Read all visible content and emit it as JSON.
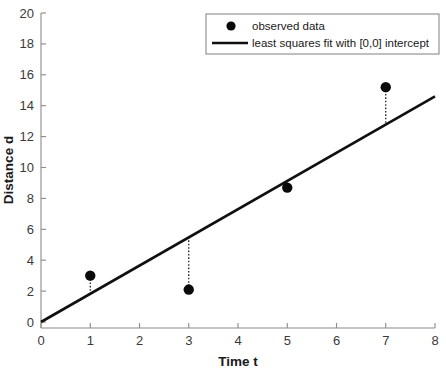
{
  "chart_data": {
    "type": "scatter",
    "title": "",
    "xlabel": "Time t",
    "ylabel": "Distance d",
    "xlim": [
      0,
      8
    ],
    "ylim": [
      0,
      20
    ],
    "xticks": [
      0,
      1,
      2,
      3,
      4,
      5,
      6,
      7,
      8
    ],
    "xtick_labels": [
      "0",
      "1",
      "2",
      "3",
      "4",
      "5",
      "6",
      "7",
      "8"
    ],
    "yticks": [
      0,
      2,
      4,
      6,
      8,
      10,
      12,
      14,
      16,
      18,
      20
    ],
    "ytick_labels": [
      "0",
      "2",
      "4",
      "6",
      "8",
      "10",
      "12",
      "14",
      "16",
      "18",
      "20"
    ],
    "grid": false,
    "legend_position": "top-right",
    "series": [
      {
        "name": "observed data",
        "type": "scatter",
        "marker": "circle",
        "color": "#0a0a0a",
        "x": [
          1,
          3,
          5,
          7
        ],
        "values": [
          3.0,
          2.1,
          8.7,
          15.2
        ]
      },
      {
        "name": "least squares fit with [0,0] intercept",
        "type": "line",
        "color": "#101010",
        "slope": 1.83,
        "intercept": 0,
        "x": [
          0,
          8
        ],
        "values": [
          0,
          14.6
        ]
      }
    ],
    "residual_stems": [
      {
        "x": 1,
        "y_data": 3.0,
        "y_fit": 1.83
      },
      {
        "x": 3,
        "y_data": 2.1,
        "y_fit": 5.49
      },
      {
        "x": 5,
        "y_data": 8.7,
        "y_fit": 9.15
      },
      {
        "x": 7,
        "y_data": 15.2,
        "y_fit": 12.81
      }
    ],
    "legend": [
      {
        "label": "observed data",
        "marker": "circle"
      },
      {
        "label": "least squares fit with [0,0] intercept",
        "marker": "line"
      }
    ]
  },
  "axes": {
    "x_title": "Time t",
    "y_title": "Distance d"
  }
}
